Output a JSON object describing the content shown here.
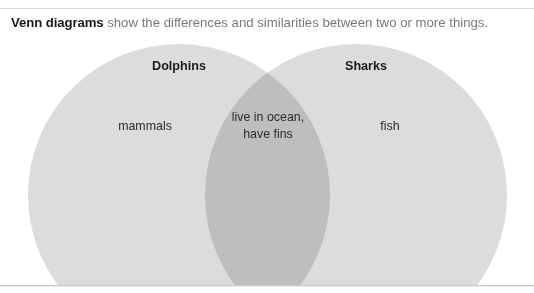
{
  "caption": {
    "lead": "Venn diagrams",
    "rest": " show the differences and similarities between two or more things."
  },
  "diagram": {
    "type": "venn",
    "sets": [
      {
        "name": "Dolphins",
        "only_label": "mammals"
      },
      {
        "name": "Sharks",
        "only_label": "fish"
      }
    ],
    "intersection": {
      "line1": "live in ocean,",
      "line2": "have fins"
    }
  },
  "colors": {
    "circle_fill": "#dcdcdc",
    "intersection_fill": "#bcbcbc",
    "page_background": "#ffffff",
    "frame_rule": "#d6d8da",
    "caption_lead_text": "#1a1a1a",
    "caption_rest_text": "#77797c",
    "set_title_text": "#1a1a1a",
    "region_label_text": "#2b2b2b"
  }
}
